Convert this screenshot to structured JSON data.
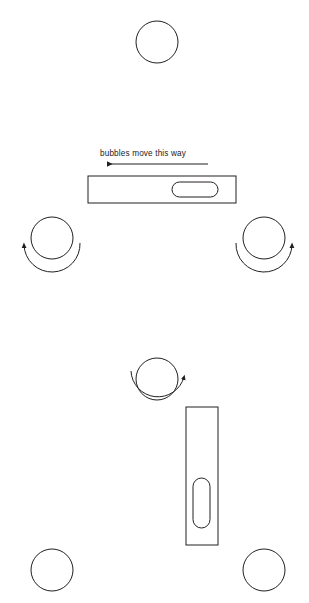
{
  "diagram": {
    "background_color": "#ffffff",
    "stroke_color": "#231f20",
    "annotations": [
      {
        "id": "bubbles-move-this-way",
        "text": "bubbles move this way",
        "x": 100,
        "y": 149
      }
    ],
    "direction_arrow": {
      "name": "bubbles-direction-arrow",
      "points": "left",
      "x_start": 208,
      "x_end": 104,
      "y": 164
    },
    "scenes": [
      {
        "id": "horizontal-level-scene",
        "level": {
          "name": "horizontal-spirit-level",
          "orientation": "horizontal",
          "x": 88,
          "y": 176,
          "width": 148,
          "height": 27,
          "vial": {
            "name": "horizontal-level-vial",
            "x": 172,
            "y": 182,
            "width": 46,
            "height": 15,
            "radius": 7.5
          }
        }
      },
      {
        "id": "vertical-level-scene",
        "level": {
          "name": "vertical-spirit-level",
          "orientation": "vertical",
          "x": 186,
          "y": 407,
          "width": 32,
          "height": 138,
          "vial": {
            "name": "vertical-level-vial",
            "x": 193,
            "y": 478,
            "width": 17,
            "height": 50,
            "radius": 8.5
          }
        }
      }
    ],
    "circles": [
      {
        "name": "circle-top",
        "cx": 157,
        "cy": 42,
        "r": 21,
        "rotation": "none"
      },
      {
        "name": "circle-mid-left",
        "cx": 52,
        "cy": 238,
        "r": 21,
        "rotation": "counterclockwise"
      },
      {
        "name": "circle-mid-right",
        "cx": 264,
        "cy": 238,
        "r": 21,
        "rotation": "clockwise"
      },
      {
        "name": "circle-center-lower",
        "cx": 157,
        "cy": 379,
        "r": 21,
        "rotation": "clockwise"
      },
      {
        "name": "circle-bottom-left",
        "cx": 52,
        "cy": 570,
        "r": 21,
        "rotation": "none"
      },
      {
        "name": "circle-bottom-right",
        "cx": 264,
        "cy": 570,
        "r": 21,
        "rotation": "none"
      }
    ],
    "rotation_arrows": [
      {
        "name": "rotation-arrow-ccw-left",
        "attached_to": "circle-mid-left",
        "direction": "counterclockwise",
        "head_position": "upper-left"
      },
      {
        "name": "rotation-arrow-cw-right",
        "attached_to": "circle-mid-right",
        "direction": "clockwise",
        "head_position": "upper-right"
      },
      {
        "name": "rotation-arrow-cw-center",
        "attached_to": "circle-center-lower",
        "direction": "clockwise",
        "head_position": "right"
      }
    ]
  }
}
